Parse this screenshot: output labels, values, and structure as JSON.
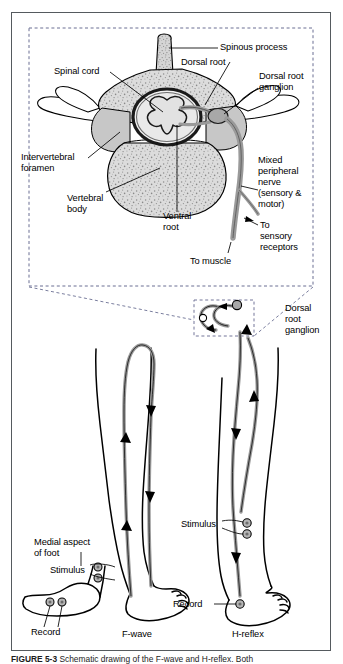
{
  "figure": {
    "caption_label": "FIGURE 5-3",
    "caption_text": " Schematic drawing of the F-wave and H-reflex. Both",
    "frame_color": "#555a5e"
  },
  "top_panel": {
    "name": "vertebra-cross-section-inset",
    "labels": {
      "spinous_process": "Spinous process",
      "dorsal_root": "Dorsal root",
      "dorsal_root_ganglion_line1": "Dorsal root",
      "dorsal_root_ganglion_line2": "ganglion",
      "spinal_cord": "Spinal cord",
      "intervertebral_foramen_line1": "Intervertebral",
      "intervertebral_foramen_line2": "foramen",
      "vertebral_body_line1": "Vertebral",
      "vertebral_body_line2": "body",
      "ventral_root_line1": "Ventral",
      "ventral_root_line2": "root",
      "mixed_nerve_line1": "Mixed",
      "mixed_nerve_line2": "peripheral",
      "mixed_nerve_line3": "nerve",
      "mixed_nerve_line4": "(sensory &",
      "mixed_nerve_line5": "motor)",
      "to_sensory_line1": "To",
      "to_sensory_line2": "sensory",
      "to_sensory_line3": "receptors",
      "to_muscle": "To muscle"
    }
  },
  "bottom_panel": {
    "name": "f-wave-h-reflex-legs",
    "labels": {
      "dorsal_root_ganglion_line1": "Dorsal",
      "dorsal_root_ganglion_line2": "root",
      "dorsal_root_ganglion_line3": "ganglion",
      "medial_aspect_line1": "Medial aspect",
      "medial_aspect_line2": "of foot",
      "stimulus_foot": "Stimulus",
      "record_foot": "Record",
      "stimulus_leg": "Stimulus",
      "record_leg": "Record",
      "f_wave": "F-wave",
      "h_reflex": "H-reflex"
    }
  },
  "colors": {
    "nerve_gray": "#9a9a9a",
    "bone_fill": "#d8d8d8",
    "cord_fill": "#b8b8b8",
    "outline": "#000000",
    "dashed": "#6b6f93"
  }
}
